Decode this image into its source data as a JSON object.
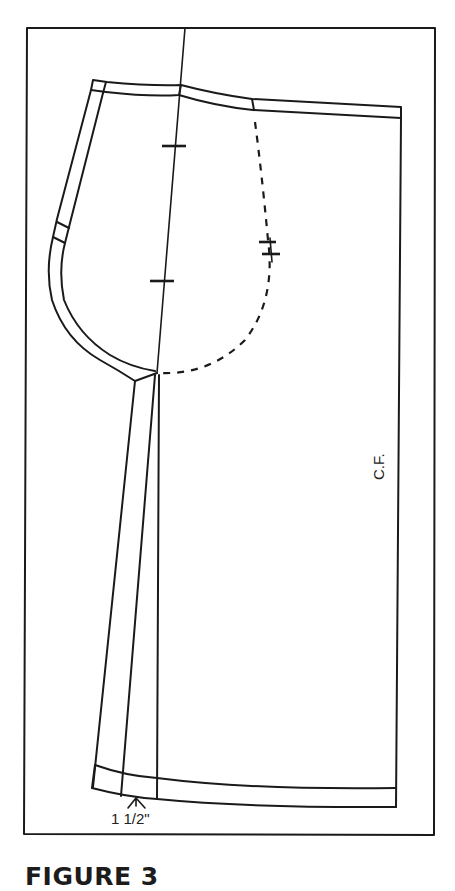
{
  "figure": {
    "caption": "FIGURE 3",
    "labels": {
      "center_front": "C.F.",
      "hem_measure": "1 1/2\""
    },
    "line_color": "#1a1a1a",
    "background": "#ffffff"
  }
}
